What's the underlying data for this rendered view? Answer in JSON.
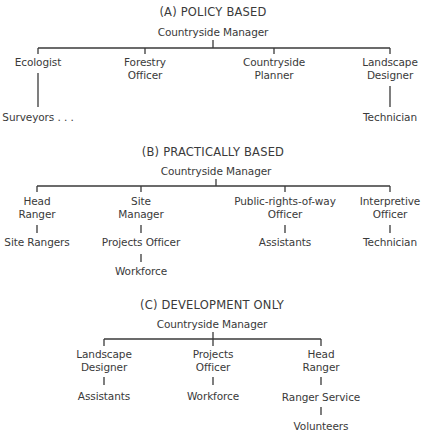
{
  "sections": [
    {
      "title": "(A) POLICY BASED",
      "root": "Countryside Manager",
      "children": [
        {
          "label": [
            "Ecologist"
          ],
          "sub": [
            "Surveyors . . ."
          ]
        },
        {
          "label": [
            "Forestry",
            "Officer"
          ],
          "sub": []
        },
        {
          "label": [
            "Countryside",
            "Planner"
          ],
          "sub": []
        },
        {
          "label": [
            "Landscape",
            "Designer"
          ],
          "sub": [
            "Technician"
          ]
        }
      ]
    },
    {
      "title": "(B) PRACTICALLY BASED",
      "root": "Countryside Manager",
      "children": [
        {
          "label": [
            "Head",
            "Ranger"
          ],
          "sub": [
            "Site Rangers"
          ]
        },
        {
          "label": [
            "Site",
            "Manager"
          ],
          "sub": [
            "Projects Officer",
            "Workforce"
          ]
        },
        {
          "label": [
            "Public-rights-of-way",
            "Officer"
          ],
          "sub": [
            "Assistants"
          ]
        },
        {
          "label": [
            "Interpretive",
            "Officer"
          ],
          "sub": [
            "Technician"
          ]
        }
      ]
    },
    {
      "title": "(C) DEVELOPMENT ONLY",
      "root": "Countryside Manager",
      "children": [
        {
          "label": [
            "Landscape",
            "Designer"
          ],
          "sub": [
            "Assistants"
          ]
        },
        {
          "label": [
            "Projects",
            "Officer"
          ],
          "sub": [
            "Workforce"
          ]
        },
        {
          "label": [
            "Head",
            "Ranger"
          ],
          "sub": [
            "Ranger Service",
            "Volunteers"
          ]
        }
      ]
    }
  ]
}
